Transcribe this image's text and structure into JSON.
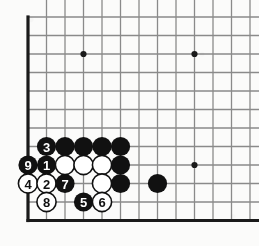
{
  "board": {
    "title": "Go board corner diagram",
    "size_label": "19x19",
    "view": "bottom-left corner",
    "origin_x": 28,
    "origin_y": 17,
    "spacing": 18.5,
    "cols_visible": 13,
    "rows_visible": 12,
    "edge_left": true,
    "edge_bottom": true,
    "edge_top": false,
    "edge_right": false,
    "line_color": "#8a8a8a",
    "edge_color": "#1a1a1a",
    "background_color": "#fbfbfa",
    "stone_radius": 9.6,
    "black_color": "#111111",
    "white_color": "#ffffff",
    "white_outline_color": "#111111",
    "star_points": [
      {
        "col": 3,
        "row": 2
      },
      {
        "col": 9,
        "row": 2
      },
      {
        "col": 9,
        "row": 8
      }
    ],
    "stones": [
      {
        "col": 1,
        "row": 7,
        "color": "black",
        "label": "3"
      },
      {
        "col": 2,
        "row": 7,
        "color": "black",
        "label": ""
      },
      {
        "col": 3,
        "row": 7,
        "color": "black",
        "label": ""
      },
      {
        "col": 4,
        "row": 7,
        "color": "black",
        "label": ""
      },
      {
        "col": 5,
        "row": 7,
        "color": "black",
        "label": ""
      },
      {
        "col": 0,
        "row": 8,
        "color": "black",
        "label": "9"
      },
      {
        "col": 1,
        "row": 8,
        "color": "black",
        "label": "1"
      },
      {
        "col": 2,
        "row": 8,
        "color": "white",
        "label": ""
      },
      {
        "col": 3,
        "row": 8,
        "color": "white",
        "label": ""
      },
      {
        "col": 4,
        "row": 8,
        "color": "white",
        "label": ""
      },
      {
        "col": 5,
        "row": 8,
        "color": "black",
        "label": ""
      },
      {
        "col": 0,
        "row": 9,
        "color": "white",
        "label": "4"
      },
      {
        "col": 1,
        "row": 9,
        "color": "white",
        "label": "2"
      },
      {
        "col": 2,
        "row": 9,
        "color": "black",
        "label": "7"
      },
      {
        "col": 4,
        "row": 9,
        "color": "white",
        "label": ""
      },
      {
        "col": 5,
        "row": 9,
        "color": "black",
        "label": ""
      },
      {
        "col": 7,
        "row": 9,
        "color": "black",
        "label": ""
      },
      {
        "col": 1,
        "row": 10,
        "color": "white",
        "label": "8"
      },
      {
        "col": 3,
        "row": 10,
        "color": "black",
        "label": "5"
      },
      {
        "col": 4,
        "row": 10,
        "color": "white",
        "label": "6"
      }
    ],
    "move_sequence": [
      {
        "number": "1",
        "color": "black"
      },
      {
        "number": "2",
        "color": "white"
      },
      {
        "number": "3",
        "color": "black"
      },
      {
        "number": "4",
        "color": "white"
      },
      {
        "number": "5",
        "color": "black"
      },
      {
        "number": "6",
        "color": "white"
      },
      {
        "number": "7",
        "color": "black"
      },
      {
        "number": "8",
        "color": "white"
      },
      {
        "number": "9",
        "color": "black"
      }
    ]
  }
}
